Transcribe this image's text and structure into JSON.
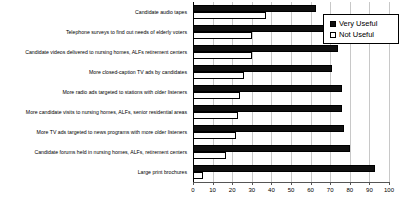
{
  "chart_data": {
    "type": "bar",
    "orientation": "horizontal",
    "title": "",
    "subtitle": "",
    "xlabel": "",
    "ylabel": "",
    "xlim": [
      0,
      100
    ],
    "xticks": [
      0,
      10,
      20,
      30,
      40,
      50,
      60,
      70,
      80,
      90,
      100
    ],
    "xtick_labels": [
      "0",
      "10",
      "20",
      "30",
      "40",
      "50",
      "60",
      "70",
      "80",
      "90",
      "100"
    ],
    "grid": true,
    "grid_axis": "x",
    "legend_position": "top-right",
    "categories": [
      "Candidate audio tapes",
      "Telephone surveys to find out needs of elderly voters",
      "Candidate videos delivered to nursing homes, ALFs retirement centers",
      "More closed-caption TV ads by candidates",
      "More radio ads targeted to stations with older listeners",
      "More candidate visits to nursing homes, ALFs, senior residential areas",
      "More TV ads targeted to news programs with more older listeners",
      "Candidate forums held in nursing homes, ALFs, retirement centers",
      "Large print brochures"
    ],
    "series": [
      {
        "name": "Very Useful",
        "color": "#101010",
        "values": [
          63,
          74,
          74,
          71,
          76,
          76,
          77,
          80,
          93
        ]
      },
      {
        "name": "Not Useful",
        "color": "#ffffff",
        "values": [
          37,
          30,
          30,
          26,
          24,
          23,
          22,
          17,
          5
        ]
      }
    ]
  },
  "legend": {
    "items": [
      {
        "label": "Very Useful",
        "swatch": "filled-black-square"
      },
      {
        "label": "Not Useful",
        "swatch": "hollow-white-square"
      }
    ]
  },
  "axis": {
    "x_tick_labels": [
      "0",
      "10",
      "20",
      "30",
      "40",
      "50",
      "60",
      "70",
      "80",
      "90",
      "100"
    ]
  },
  "colors": {
    "very_useful": "#101010",
    "not_useful": "#ffffff",
    "gridline": "#c8c8c8",
    "axis": "#555555",
    "text": "#000000",
    "background": "#ffffff"
  }
}
